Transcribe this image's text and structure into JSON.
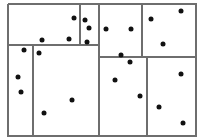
{
  "diagram": {
    "type": "rectangular-partition-with-points",
    "colors": {
      "background": "#ffffff",
      "line": "#6e6e6e",
      "point": "#111111"
    },
    "border": {
      "x": 8,
      "y": 4,
      "width": 188,
      "height": 132
    },
    "lines": [
      {
        "id": "h-top-left",
        "x1": 8,
        "y1": 45,
        "x2": 99,
        "y2": 45
      },
      {
        "id": "h-top-right",
        "x1": 99,
        "y1": 57,
        "x2": 196,
        "y2": 57
      },
      {
        "id": "v-80",
        "x1": 80,
        "y1": 4,
        "x2": 80,
        "y2": 45
      },
      {
        "id": "v-99",
        "x1": 99,
        "y1": 4,
        "x2": 99,
        "y2": 136
      },
      {
        "id": "v-142",
        "x1": 142,
        "y1": 4,
        "x2": 142,
        "y2": 57
      },
      {
        "id": "v-33",
        "x1": 33,
        "y1": 45,
        "x2": 33,
        "y2": 136
      },
      {
        "id": "v-147",
        "x1": 147,
        "y1": 57,
        "x2": 147,
        "y2": 136
      }
    ],
    "points": [
      {
        "x": 74,
        "y": 18
      },
      {
        "x": 85,
        "y": 20
      },
      {
        "x": 89,
        "y": 28
      },
      {
        "x": 87,
        "y": 42
      },
      {
        "x": 42,
        "y": 40
      },
      {
        "x": 69,
        "y": 39
      },
      {
        "x": 106,
        "y": 29
      },
      {
        "x": 131,
        "y": 29
      },
      {
        "x": 151,
        "y": 19
      },
      {
        "x": 181,
        "y": 11
      },
      {
        "x": 163,
        "y": 44
      },
      {
        "x": 121,
        "y": 55
      },
      {
        "x": 130,
        "y": 62
      },
      {
        "x": 24,
        "y": 50
      },
      {
        "x": 39,
        "y": 53
      },
      {
        "x": 18,
        "y": 77
      },
      {
        "x": 21,
        "y": 92
      },
      {
        "x": 72,
        "y": 100
      },
      {
        "x": 44,
        "y": 113
      },
      {
        "x": 115,
        "y": 80
      },
      {
        "x": 140,
        "y": 96
      },
      {
        "x": 181,
        "y": 74
      },
      {
        "x": 159,
        "y": 107
      },
      {
        "x": 183,
        "y": 123
      }
    ]
  }
}
